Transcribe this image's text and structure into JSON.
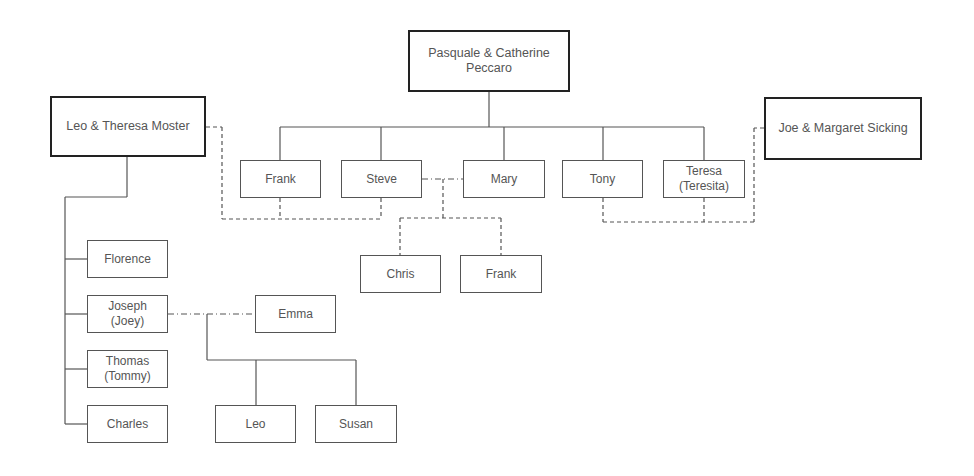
{
  "diagram": {
    "type": "family-tree",
    "colors": {
      "line": "#555555",
      "strong_border": "#222222",
      "text": "#555555",
      "background": "#ffffff"
    },
    "couples": {
      "peccaro": {
        "label": "Pasquale & Catherine\nPeccaro",
        "line1": "Pasquale & Catherine",
        "line2": "Peccaro"
      },
      "moster": {
        "label": "Leo & Theresa Moster"
      },
      "sicking": {
        "label": "Joe & Margaret Sicking"
      }
    },
    "peccaro_children": [
      {
        "label": "Frank"
      },
      {
        "label": "Steve"
      },
      {
        "label": "Mary"
      },
      {
        "label": "Tony"
      },
      {
        "label": "Teresa",
        "line2": "(Teresita)"
      }
    ],
    "steve_mary_children": [
      {
        "label": "Chris"
      },
      {
        "label": "Frank"
      }
    ],
    "moster_children": [
      {
        "label": "Florence"
      },
      {
        "label": "Joseph",
        "line2": "(Joey)"
      },
      {
        "label": "Thomas",
        "line2": "(Tommy)"
      },
      {
        "label": "Charles"
      }
    ],
    "joseph_spouse": {
      "label": "Emma"
    },
    "joseph_emma_children": [
      {
        "label": "Leo"
      },
      {
        "label": "Susan"
      }
    ]
  }
}
